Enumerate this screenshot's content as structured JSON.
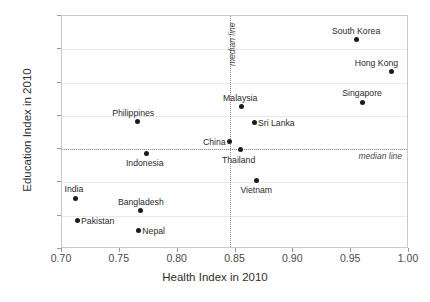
{
  "chart_data": {
    "type": "scatter",
    "title": "",
    "xlabel": "Health Index in 2010",
    "ylabel": "Education Index in 2010",
    "xlim": [
      0.7,
      1.0
    ],
    "ylim": [
      0.3,
      1.0
    ],
    "xticks": [
      "0.70",
      "0.75",
      "0.80",
      "0.85",
      "0.90",
      "0.95",
      "1.00"
    ],
    "xtick_values": [
      0.7,
      0.75,
      0.8,
      0.85,
      0.9,
      0.95,
      1.0
    ],
    "yticks": [
      "0.3",
      "0.4",
      "0.5",
      "0.6",
      "0.7",
      "0.8",
      "0.9",
      "1.0"
    ],
    "ytick_values": [
      0.3,
      0.4,
      0.5,
      0.6,
      0.7,
      0.8,
      0.9,
      1.0
    ],
    "grid": true,
    "legend": "none",
    "annotations": [
      {
        "name": "vertical-median-line",
        "text": "median line",
        "orientation": "vertical",
        "value": 0.845
      },
      {
        "name": "horizontal-median-line",
        "text": "median line",
        "orientation": "horizontal",
        "value": 0.6
      }
    ],
    "points": [
      {
        "label": "South Korea",
        "x": 0.955,
        "y": 0.928,
        "label_pos": "above"
      },
      {
        "label": "Hong Kong",
        "x": 0.985,
        "y": 0.833,
        "label_pos": "above-left"
      },
      {
        "label": "Singapore",
        "x": 0.96,
        "y": 0.741,
        "label_pos": "above"
      },
      {
        "label": "Malaysia",
        "x": 0.855,
        "y": 0.727,
        "label_pos": "above"
      },
      {
        "label": "Sri Lanka",
        "x": 0.866,
        "y": 0.68,
        "label_pos": "right"
      },
      {
        "label": "Philippines",
        "x": 0.765,
        "y": 0.682,
        "label_pos": "above"
      },
      {
        "label": "China",
        "x": 0.845,
        "y": 0.622,
        "label_pos": "left"
      },
      {
        "label": "Thailand",
        "x": 0.854,
        "y": 0.598,
        "label_pos": "below"
      },
      {
        "label": "Indonesia",
        "x": 0.773,
        "y": 0.588,
        "label_pos": "below"
      },
      {
        "label": "Vietnam",
        "x": 0.868,
        "y": 0.507,
        "label_pos": "below"
      },
      {
        "label": "India",
        "x": 0.712,
        "y": 0.452,
        "label_pos": "above"
      },
      {
        "label": "Bangladesh",
        "x": 0.768,
        "y": 0.415,
        "label_pos": "above"
      },
      {
        "label": "Pakistan",
        "x": 0.713,
        "y": 0.385,
        "label_pos": "right"
      },
      {
        "label": "Nepal",
        "x": 0.766,
        "y": 0.355,
        "label_pos": "right"
      }
    ]
  }
}
